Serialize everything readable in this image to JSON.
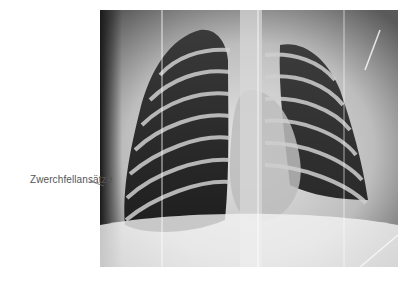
{
  "figure": {
    "type": "chest-xray",
    "view": "frontal",
    "annotations": [
      {
        "label": "Zwerchfellansätze"
      }
    ]
  },
  "colors": {
    "background": "#ffffff",
    "label_text": "#555555"
  }
}
